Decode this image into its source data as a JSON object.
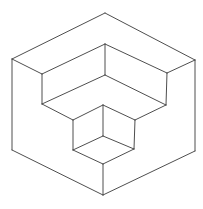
{
  "figure": {
    "stroke_color": "#3a3a3a",
    "background": "#ffffff",
    "stroke_width": 0.9,
    "vertices": {
      "outer_top": [
        105,
        13
      ],
      "outer_left_top": [
        12,
        59
      ],
      "outer_right_top": [
        195,
        60
      ],
      "outer_left_bottom": [
        12,
        150
      ],
      "outer_right_bottom": [
        195,
        151
      ],
      "outer_bottom": [
        103,
        195
      ],
      "inner_left_top": [
        42,
        74
      ],
      "inner_top": [
        105,
        44
      ],
      "inner_right_top": [
        167,
        73
      ],
      "inner_left_bottom": [
        42,
        104
      ],
      "step_corner": [
        105,
        75
      ],
      "inner_right_bottom": [
        166,
        105
      ],
      "small_left_top": [
        73,
        120
      ],
      "small_top": [
        103,
        105
      ],
      "small_right_top": [
        135,
        120
      ],
      "small_center": [
        103,
        136
      ],
      "small_left_bottom": [
        73,
        150
      ],
      "small_right_bottom": [
        134,
        149
      ],
      "small_bottom": [
        103,
        164
      ]
    },
    "edges": [
      [
        "outer_top",
        "outer_left_top"
      ],
      [
        "outer_top",
        "outer_right_top"
      ],
      [
        "outer_left_top",
        "outer_left_bottom"
      ],
      [
        "outer_right_top",
        "outer_right_bottom"
      ],
      [
        "outer_left_bottom",
        "outer_bottom"
      ],
      [
        "outer_right_bottom",
        "outer_bottom"
      ],
      [
        "outer_left_top",
        "inner_left_top"
      ],
      [
        "outer_right_top",
        "inner_right_top"
      ],
      [
        "inner_left_top",
        "inner_top"
      ],
      [
        "inner_top",
        "inner_right_top"
      ],
      [
        "inner_top",
        "step_corner"
      ],
      [
        "inner_left_top",
        "inner_left_bottom"
      ],
      [
        "inner_right_top",
        "inner_right_bottom"
      ],
      [
        "inner_left_bottom",
        "step_corner"
      ],
      [
        "step_corner",
        "inner_right_bottom"
      ],
      [
        "inner_left_bottom",
        "small_left_top"
      ],
      [
        "inner_right_bottom",
        "small_right_top"
      ],
      [
        "small_left_top",
        "small_top"
      ],
      [
        "small_top",
        "small_right_top"
      ],
      [
        "small_top",
        "small_center"
      ],
      [
        "small_left_top",
        "small_left_bottom"
      ],
      [
        "small_right_top",
        "small_right_bottom"
      ],
      [
        "small_left_bottom",
        "small_center"
      ],
      [
        "small_center",
        "small_right_bottom"
      ],
      [
        "small_left_bottom",
        "small_bottom"
      ],
      [
        "small_right_bottom",
        "small_bottom"
      ],
      [
        "small_bottom",
        "outer_bottom"
      ]
    ]
  }
}
